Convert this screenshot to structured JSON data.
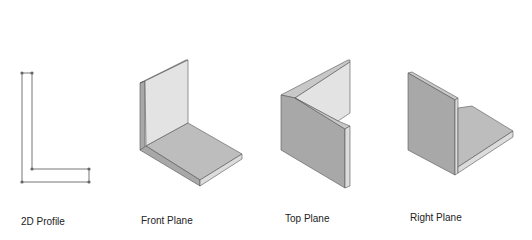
{
  "figures": [
    {
      "id": "2d-profile",
      "label": "2D Profile"
    },
    {
      "id": "front-plane",
      "label": "Front Plane"
    },
    {
      "id": "top-plane",
      "label": "Top Plane"
    },
    {
      "id": "right-plane",
      "label": "Right Plane"
    }
  ],
  "colors": {
    "light_face": "#e3e3e3",
    "mid_face": "#bdbdbd",
    "dark_face": "#a8a8a8",
    "edge": "#555555",
    "outline": "#666666"
  }
}
